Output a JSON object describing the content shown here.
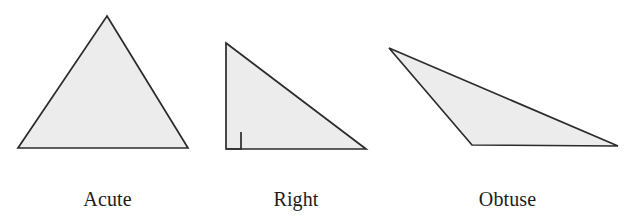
{
  "figure": {
    "name": "triangle-classification-figure",
    "background_color": "#ffffff",
    "shape_fill_color": "#ececec",
    "shape_stroke_color": "#2b2b2b"
  },
  "shapes": [
    {
      "id": "acute",
      "label_line1": "Acute",
      "label_line2": "triangle",
      "points": "107,16 188,148 18,148",
      "has_right_angle_mark": false
    },
    {
      "id": "right",
      "label_line1": "Right",
      "label_line2": "triangle",
      "points": "226,43 366,149 226,149",
      "has_right_angle_mark": true,
      "right_angle_mark": "241,132 241,149 226,149"
    },
    {
      "id": "obtuse",
      "label_line1": "Obtuse",
      "label_line2": "triangle",
      "points": "389,48 618,146 472,145",
      "has_right_angle_mark": false
    }
  ]
}
